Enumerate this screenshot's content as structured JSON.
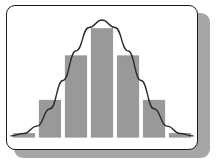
{
  "panel": {
    "background_color": "#ffffff",
    "border_color": "#1c1c1c",
    "shadow_color": "#a6a6a6",
    "corner_radius": "9"
  },
  "chart_data": {
    "type": "bar",
    "title": "",
    "subtitle": "",
    "xlabel": "",
    "ylabel": "",
    "grid": false,
    "legend": false,
    "legend_position": "none",
    "axis_ticks": false,
    "tick_labels": [],
    "annotations": [],
    "categories": [
      "-3",
      "-2",
      "-1",
      "0",
      "1",
      "2",
      "3"
    ],
    "values": [
      3,
      30,
      66,
      88,
      66,
      30,
      3
    ],
    "ylim": [
      0,
      100
    ],
    "xlim": [
      -3.5,
      3.5
    ],
    "bar_color": "#999999",
    "bar_edge_color": "#8a8a8a",
    "series": [
      {
        "name": "Histogram",
        "type": "bar",
        "values": [
          3,
          30,
          66,
          88,
          66,
          30,
          3
        ]
      },
      {
        "name": "Normal curve",
        "type": "line",
        "color": "#2b2b2b",
        "x": [
          -3.5,
          -3.0,
          -2.5,
          -2.0,
          -1.5,
          -1.0,
          -0.5,
          0.0,
          0.5,
          1.0,
          1.5,
          2.0,
          2.5,
          3.0,
          3.5
        ],
        "values": [
          1,
          3,
          9,
          23,
          46,
          70,
          89,
          95,
          89,
          70,
          46,
          23,
          9,
          3,
          1
        ]
      }
    ]
  }
}
